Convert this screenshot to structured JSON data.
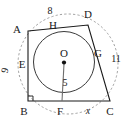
{
  "figure": {
    "type": "geometry-diagram",
    "canvas": {
      "width": 127,
      "height": 118
    },
    "colors": {
      "stroke": "#1a1a1a",
      "circle": "#3a3a3a",
      "dashed_ellipse": "#9a9a9a",
      "radius": "#6e6e6e",
      "background": "#ffffff"
    },
    "vertices": [
      {
        "id": "A",
        "label": "A",
        "x": 28,
        "y": 31,
        "label_x": 17,
        "label_y": 29
      },
      {
        "id": "B",
        "label": "B",
        "x": 28,
        "y": 101,
        "label_x": 22,
        "label_y": 114
      },
      {
        "id": "C",
        "label": "C",
        "x": 110,
        "y": 101,
        "label_x": 107,
        "label_y": 114
      },
      {
        "id": "D",
        "label": "D",
        "x": 88,
        "y": 25,
        "label_x": 85,
        "label_y": 16
      }
    ],
    "tangent_points": [
      {
        "id": "H",
        "label": "H",
        "x": 58,
        "y": 30,
        "label_x": 50,
        "label_y": 26
      },
      {
        "id": "E",
        "label": "E",
        "x": 30,
        "y": 60,
        "label_x": 18,
        "label_y": 66
      },
      {
        "id": "F",
        "label": "F",
        "x": 62,
        "y": 101,
        "label_x": 57,
        "label_y": 114
      },
      {
        "id": "G",
        "label": "G",
        "x": 95,
        "y": 64,
        "label_x": 95,
        "label_y": 54
      }
    ],
    "center": {
      "id": "O",
      "label": "O",
      "x": 64,
      "y": 62,
      "label_x": 59,
      "label_y": 56,
      "dot_radius": 2.1
    },
    "incircle": {
      "cx": 64,
      "cy": 62,
      "r": 30.5
    },
    "outer_ellipse": {
      "cx": 68,
      "cy": 64,
      "rx": 50,
      "ry": 50,
      "rotation": -12
    },
    "radius_segment": {
      "from": "O",
      "to": "F",
      "x1": 64,
      "y1": 64,
      "x2": 62,
      "y2": 101
    },
    "right_angle_marker": {
      "at": "B",
      "x": 28,
      "y": 101,
      "size": 5
    },
    "measure_labels": [
      {
        "id": "top",
        "text": "8",
        "for_side": "AD",
        "x": 47,
        "y": 13,
        "italic": false
      },
      {
        "id": "right",
        "text": "11",
        "for_side": "DC",
        "x": 112,
        "y": 60,
        "italic": false
      },
      {
        "id": "left",
        "text": "9",
        "for_side": "AB",
        "x": 5,
        "y": 68,
        "italic": false
      },
      {
        "id": "radius",
        "text": "5",
        "for_side": "OF",
        "x": 62,
        "y": 84,
        "italic": false
      },
      {
        "id": "bottom",
        "text": "x",
        "for_side": "FC",
        "x": 88,
        "y": 113,
        "italic": true
      }
    ]
  }
}
